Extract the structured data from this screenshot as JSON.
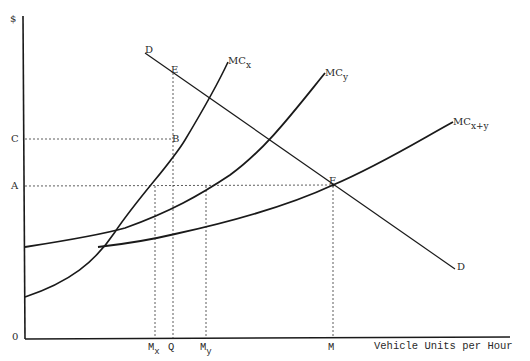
{
  "diagram": {
    "axes": {
      "y_label": "$",
      "x_label": "Vehicle Units per Hour",
      "origin_label": "0"
    },
    "y_ticks": [
      {
        "label": "C"
      },
      {
        "label": "A"
      }
    ],
    "x_ticks": [
      {
        "label": "M",
        "sub": "x"
      },
      {
        "label": "Q",
        "sub": ""
      },
      {
        "label": "M",
        "sub": "y"
      },
      {
        "label": "M",
        "sub": ""
      }
    ],
    "curves": {
      "demand": {
        "label_start": "D",
        "label_end": "D"
      },
      "mc_x": {
        "label": "MC",
        "sub": "x"
      },
      "mc_y": {
        "label": "MC",
        "sub": "y"
      },
      "mc_xy": {
        "label": "MC",
        "sub": "x+y"
      }
    },
    "points": {
      "E": "E",
      "B": "B",
      "F": "F"
    }
  }
}
